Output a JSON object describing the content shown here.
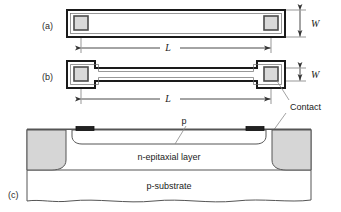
{
  "figure": {
    "background_color": "#ffffff",
    "line_color": "#1a1a1a",
    "thin_line_color": "#555555",
    "pad_fill": "#d9d9d9",
    "diffusion_fill": "#d6d6d6",
    "body_fill": "#ffffff"
  },
  "panels": {
    "a": {
      "label": "(a)",
      "description": "Straight bar resistor, top view"
    },
    "b": {
      "label": "(b)",
      "description": "Narrow strip resistor with enlarged contact pads, top view"
    },
    "c": {
      "label": "(c)",
      "description": "Cross-section of diffused resistor"
    }
  },
  "dimensions": {
    "width_symbol_a": "W",
    "width_symbol_b": "W",
    "length_symbol_a": "L",
    "length_symbol_b": "L"
  },
  "annotations": {
    "contact": "Contact",
    "p_region": "p",
    "epi_layer": "n-epitaxial layer",
    "substrate": "p-substrate"
  }
}
